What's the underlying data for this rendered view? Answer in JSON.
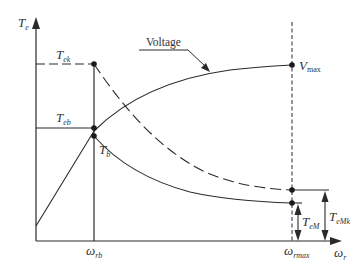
{
  "diagram": {
    "type": "torque-speed characteristic",
    "colors": {
      "line": "#2a2a2a",
      "text": "#333333",
      "background": "#ffffff"
    },
    "axes": {
      "y_label": {
        "main": "T",
        "sub": "e"
      },
      "x_label": {
        "main": "ω",
        "sub": "r"
      }
    },
    "x_ticks": [
      {
        "main": "ω",
        "sub": "rb"
      },
      {
        "main": "ω",
        "sub": "rmax"
      }
    ],
    "levels": {
      "tek": {
        "main": "T",
        "sub": "ek"
      },
      "teb": {
        "main": "T",
        "sub": "eb"
      },
      "tb": {
        "main": "T",
        "sub": "b"
      }
    },
    "curves": {
      "voltage_label": "Voltage",
      "vmax": {
        "main": "V",
        "sub": "max"
      }
    },
    "dimensions": {
      "tem": {
        "main": "T",
        "sub": "eM"
      },
      "temk": {
        "main": "T",
        "sub": "eMk"
      }
    }
  }
}
